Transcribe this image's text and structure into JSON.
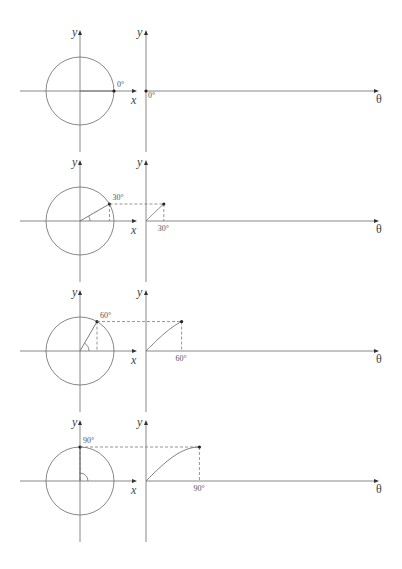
{
  "figure": {
    "axes": {
      "y": "y",
      "x": "x",
      "theta": "θ"
    },
    "colors": {
      "lines": "#7a7a7a",
      "points": "#222222",
      "text": "#444444"
    }
  },
  "panels": [
    {
      "angle_deg": 0,
      "label": "0°"
    },
    {
      "angle_deg": 30,
      "label": "30°"
    },
    {
      "angle_deg": 60,
      "label": "60°"
    },
    {
      "angle_deg": 90,
      "label": "90°"
    }
  ]
}
